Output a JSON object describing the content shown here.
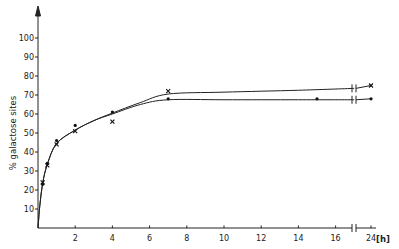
{
  "chart_data": {
    "type": "line",
    "title": "",
    "xlabel": "[h]",
    "ylabel": "% galactose sites",
    "xlim": [
      0,
      24
    ],
    "ylim": [
      0,
      100
    ],
    "x_break": [
      17,
      24
    ],
    "grid": false,
    "legend": "none",
    "x_ticks": [
      "2",
      "4",
      "6",
      "8",
      "10",
      "12",
      "14",
      "16",
      "24"
    ],
    "y_ticks": [
      "10",
      "20",
      "30",
      "40",
      "50",
      "60",
      "70",
      "80",
      "90",
      "100"
    ],
    "series": [
      {
        "name": "x",
        "marker": "x",
        "x": [
          0.25,
          0.5,
          1,
          2,
          4,
          7,
          24
        ],
        "y": [
          24,
          33,
          44,
          51,
          56,
          72,
          75
        ]
      },
      {
        "name": "dot",
        "marker": "dot",
        "x": [
          0.25,
          0.5,
          1,
          2,
          4,
          7,
          15,
          24
        ],
        "y": [
          23,
          34,
          46,
          54,
          61,
          68,
          68,
          68
        ]
      }
    ]
  }
}
